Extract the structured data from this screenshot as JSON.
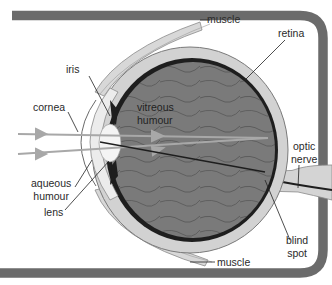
{
  "diagram": {
    "labels": {
      "muscle_top": "muscle",
      "retina": "retina",
      "iris": "iris",
      "vitreous_line1": "vitreous",
      "vitreous_line2": "humour",
      "cornea": "cornea",
      "optic_line1": "optic",
      "optic_line2": "nerve",
      "aqueous_line1": "aqueous",
      "aqueous_line2": "humour",
      "lens": "lens",
      "blind_line1": "blind",
      "blind_line2": "spot",
      "muscle_bottom": "muscle"
    },
    "colors": {
      "frame": "#6b6b6b",
      "sclera": "#cfcfcf",
      "choroid": "#1e1e1e",
      "vitreous": "#7a7a7a",
      "lens": "#f4f4f4",
      "light_ray": "#a8a8a8",
      "label_text": "#2a2a2a"
    },
    "light_rays": 2
  }
}
